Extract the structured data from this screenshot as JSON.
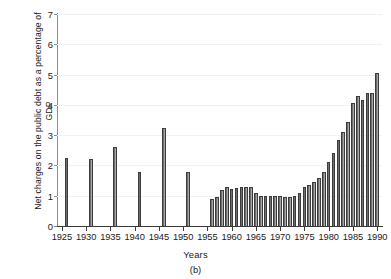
{
  "chart_data": {
    "type": "bar",
    "title": "",
    "subtitle": "",
    "caption": "(b)",
    "xlabel": "Years",
    "ylabel": "Net charges on the public debt as a percentage of GDP",
    "xlim": [
      1924,
      1991
    ],
    "ylim": [
      0,
      7
    ],
    "yticks": [
      0,
      1,
      2,
      3,
      4,
      5,
      6,
      7
    ],
    "xticks": [
      1925,
      1930,
      1935,
      1940,
      1945,
      1950,
      1955,
      1960,
      1965,
      1970,
      1975,
      1980,
      1985,
      1990
    ],
    "xtick_labels": [
      "1925",
      "1930",
      "1935",
      "1940",
      "1945",
      "1950",
      "1955",
      "1960",
      "1965",
      "1970",
      "1975",
      "1980",
      "1985",
      "1990"
    ],
    "grid": "horizontal-faint",
    "legend": "none",
    "bar_color": "#8e8e8e",
    "bar_edge_color": "#3b3b3b",
    "background_color": "#ffffff",
    "gridline_color": "#f1f1f3",
    "axis_color": "#3a3a3a",
    "note": "Isolated bars for 1926, 1931, 1936, 1941, 1946, 1951; continuous annual series from 1956 to 1990.",
    "x": [
      1926,
      1931,
      1936,
      1941,
      1946,
      1951,
      1956,
      1957,
      1958,
      1959,
      1960,
      1961,
      1962,
      1963,
      1964,
      1965,
      1966,
      1967,
      1968,
      1969,
      1970,
      1971,
      1972,
      1973,
      1974,
      1975,
      1976,
      1977,
      1978,
      1979,
      1980,
      1981,
      1982,
      1983,
      1984,
      1985,
      1986,
      1987,
      1988,
      1989,
      1990
    ],
    "values": [
      2.25,
      2.2,
      2.6,
      1.8,
      3.25,
      1.8,
      0.9,
      0.95,
      1.2,
      1.3,
      1.22,
      1.25,
      1.3,
      1.3,
      1.3,
      1.1,
      1.0,
      1.0,
      1.0,
      1.0,
      1.0,
      0.95,
      0.95,
      1.0,
      1.1,
      1.3,
      1.35,
      1.45,
      1.6,
      1.8,
      2.1,
      2.4,
      2.85,
      3.1,
      3.45,
      4.05,
      4.3,
      4.15,
      4.4,
      4.4,
      5.05
    ]
  }
}
